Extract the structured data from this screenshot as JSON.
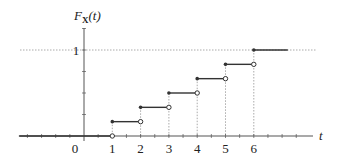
{
  "chart_data": {
    "type": "line",
    "subtype": "step-cdf",
    "title": "",
    "ylabel": "F_X(t)",
    "ylabel_main": "F",
    "ylabel_sub": "X",
    "ylabel_arg": "(t)",
    "xlabel": "t",
    "xlim": [
      -2.3,
      7.6
    ],
    "ylim": [
      0,
      1
    ],
    "x_ticks": [
      "0",
      "1",
      "2",
      "3",
      "4",
      "5",
      "6"
    ],
    "y_ticks": [
      "1"
    ],
    "steps": [
      {
        "x_start": -2.3,
        "x_end": 1,
        "y": 0,
        "left_closed": true,
        "right_open": true
      },
      {
        "x_start": 1,
        "x_end": 2,
        "y": 0.1667
      },
      {
        "x_start": 2,
        "x_end": 3,
        "y": 0.3333
      },
      {
        "x_start": 3,
        "x_end": 4,
        "y": 0.5
      },
      {
        "x_start": 4,
        "x_end": 5,
        "y": 0.6667
      },
      {
        "x_start": 5,
        "x_end": 6,
        "y": 0.8333
      },
      {
        "x_start": 6,
        "x_end": 7.2,
        "y": 1
      }
    ],
    "reference_lines": [
      {
        "orientation": "horizontal",
        "y": 1,
        "style": "dotted"
      }
    ],
    "grid": false,
    "legend": null
  },
  "colors": {
    "axis": "#555555",
    "step": "#333333",
    "dotted": "#aaaaaa",
    "text": "#222222"
  }
}
